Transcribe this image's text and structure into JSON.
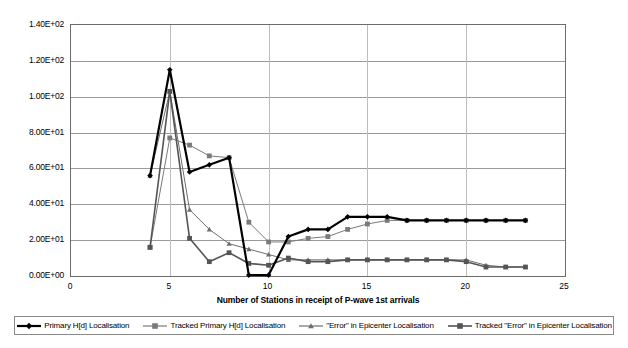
{
  "chart_data": {
    "type": "line",
    "title": "",
    "xlabel": "Number of Stations in receipt of P-wave 1st arrivals",
    "ylabel": "H[d] values / \"Error\" in Epicenter values [km]",
    "xlim": [
      0,
      25
    ],
    "ylim": [
      0,
      140
    ],
    "xticks": [
      0,
      5,
      10,
      15,
      20,
      25
    ],
    "xticklabels": [
      "0",
      "5",
      "10",
      "15",
      "20",
      "25"
    ],
    "yticks": [
      0,
      20,
      40,
      60,
      80,
      100,
      120,
      140
    ],
    "yticklabels": [
      "0.00E+00",
      "2.00E+01",
      "4.00E+01",
      "6.00E+01",
      "8.00E+01",
      "1.00E+02",
      "1.20E+02",
      "1.40E+02"
    ],
    "grid": "horizontal-and-vertical",
    "legend_position": "bottom",
    "x": [
      4,
      5,
      6,
      7,
      8,
      9,
      10,
      11,
      12,
      13,
      14,
      15,
      16,
      17,
      18,
      19,
      20,
      21,
      22,
      23
    ],
    "series": [
      {
        "name": "Primary H[d] Localisation",
        "color": "#000000",
        "marker": "diamond",
        "width": 2.2,
        "values": [
          56,
          115,
          58,
          62,
          66,
          0.5,
          0.5,
          22,
          26,
          26,
          33,
          33,
          33,
          31,
          31,
          31,
          31,
          31,
          31,
          31
        ]
      },
      {
        "name": "Tracked Primary H[d] Localisation",
        "color": "#7a7a7a",
        "marker": "square",
        "width": 1.0,
        "values": [
          16,
          77,
          73,
          67,
          66,
          30,
          19,
          19,
          21,
          22,
          26,
          29,
          31,
          31,
          31,
          31,
          31,
          31,
          31,
          31
        ]
      },
      {
        "name": "\"Error\" in Epicenter Localisation",
        "color": "#6e6e6e",
        "marker": "triangle",
        "width": 1.0,
        "values": [
          56,
          103,
          37,
          26,
          18,
          15,
          12,
          9,
          9,
          9,
          9,
          9,
          9,
          9,
          9,
          9,
          9,
          6,
          5,
          5
        ]
      },
      {
        "name": "Tracked \"Error\" in Epicenter Localisation",
        "color": "#555555",
        "marker": "square",
        "width": 1.6,
        "values": [
          16,
          103,
          21,
          8,
          13,
          7,
          6,
          10,
          8,
          8,
          9,
          9,
          9,
          9,
          9,
          9,
          8,
          5,
          5,
          5
        ]
      }
    ]
  },
  "legend": {
    "items": [
      {
        "label": "Primary H[d] Localisation"
      },
      {
        "label": "Tracked Primary H[d] Localisation"
      },
      {
        "label": "\"Error\" in Epicenter Localisation"
      },
      {
        "label": "Tracked \"Error\" in Epicenter Localisation"
      }
    ]
  }
}
